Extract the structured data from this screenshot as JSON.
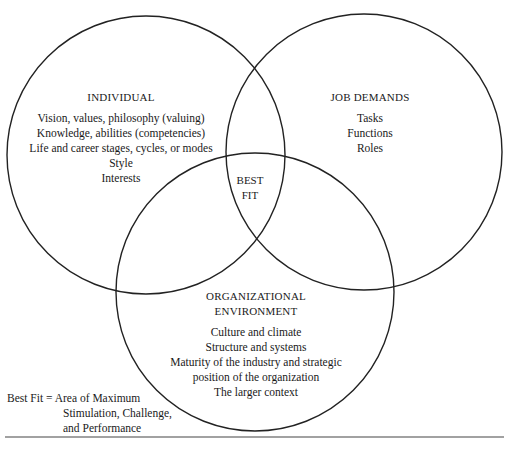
{
  "diagram": {
    "type": "venn",
    "circles": [
      {
        "id": "individual",
        "title": "INDIVIDUAL",
        "items": [
          "Vision, values, philosophy (valuing)",
          "Knowledge, abilities (competencies)",
          "Life and career stages, cycles, or modes",
          "Style",
          "Interests"
        ]
      },
      {
        "id": "job",
        "title": "JOB DEMANDS",
        "items": [
          "Tasks",
          "Functions",
          "Roles"
        ]
      },
      {
        "id": "org",
        "title_line1": "ORGANIZATIONAL",
        "title_line2": "ENVIRONMENT",
        "items": [
          "Culture and climate",
          "Structure and systems",
          "Maturity of the industry and strategic",
          "position of the organization",
          "The larger context"
        ]
      }
    ],
    "intersection": {
      "line1": "BEST",
      "line2": "FIT"
    },
    "legend": {
      "line1": "Best Fit = Area of Maximum",
      "line2": "Stimulation, Challenge,",
      "line3": "and Performance"
    },
    "colors": {
      "stroke": "#222222",
      "background": "#ffffff"
    }
  }
}
